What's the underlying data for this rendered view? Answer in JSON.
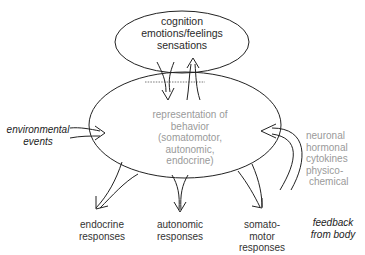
{
  "diagram": {
    "top_node": {
      "lines": [
        "cognition",
        "emotions/feelings",
        "sensations"
      ]
    },
    "center_node": {
      "lines": [
        "representation of",
        "behavior",
        "(somatomotor,",
        "autonomic,",
        "endocrine)"
      ]
    },
    "inputs": {
      "environmental": {
        "lines": [
          "environmental",
          "events"
        ]
      },
      "feedback": {
        "lines": [
          "feedback",
          "from body"
        ]
      },
      "feedback_types": {
        "lines": [
          "neuronal",
          "hormonal",
          "cytokines",
          "physico-",
          "chemical"
        ]
      }
    },
    "outputs": [
      {
        "lines": [
          "endocrine",
          "responses"
        ]
      },
      {
        "lines": [
          "autonomic",
          "responses"
        ]
      },
      {
        "lines": [
          "somato-",
          "motor",
          "responses"
        ]
      }
    ],
    "colors": {
      "stroke": "#222222",
      "grey_text": "#9a9a9a",
      "dark_text": "#2a2a2a"
    }
  }
}
